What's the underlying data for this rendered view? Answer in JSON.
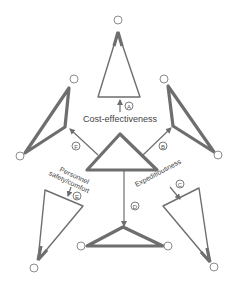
{
  "diagram": {
    "labels": {
      "center": "Cost-effectiveness",
      "left_lower_line1": "Personnel",
      "left_lower_line2": "safety/comfort",
      "right_lower": "Expeditiousness"
    },
    "markers": [
      "A",
      "B",
      "C",
      "D",
      "E",
      "F"
    ],
    "colors": {
      "stroke": "#6e6e6e",
      "node_stroke": "#8c8c8c",
      "background": "#ffffff"
    }
  }
}
